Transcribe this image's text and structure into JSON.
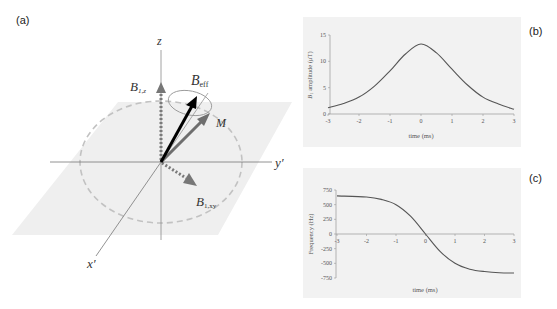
{
  "figure": {
    "panels": {
      "a": {
        "label": "(a)",
        "axes": {
          "z": "z",
          "y": "y′",
          "x": "x′"
        },
        "vectors": {
          "b1z": {
            "symbol": "B",
            "subscript": "1,z"
          },
          "beff": {
            "symbol": "B",
            "subscript": "eff"
          },
          "m": {
            "symbol": "M"
          },
          "b1xy": {
            "symbol": "B",
            "subscript": "1,xy"
          }
        },
        "colors": {
          "plane": "#efefef",
          "dashed_circle": "#bdbdbd",
          "b1_arrows": "#777777",
          "beff_arrow": "#000000",
          "m_arrow": "#6e6e6e",
          "axes": "#888888"
        }
      },
      "b": {
        "label": "(b)"
      },
      "c": {
        "label": "(c)"
      }
    }
  },
  "chart_data": [
    {
      "type": "line",
      "panel": "(b)",
      "title": "",
      "xlabel": "time (ms)",
      "ylabel": "B1 amplitude (μT)",
      "ylabel_symbol": "B",
      "ylabel_sub": "1",
      "ylabel_rest": " amplitude (μT)",
      "xlim": [
        -3,
        3
      ],
      "ylim": [
        0,
        15
      ],
      "xticks": [
        "-3",
        "-2",
        "-1",
        "0",
        "1",
        "2",
        "3"
      ],
      "yticks": [
        "0",
        "5",
        "10",
        "15"
      ],
      "grid": false,
      "series": [
        {
          "name": "B1 amplitude",
          "x": [
            -3,
            -2.5,
            -2,
            -1.5,
            -1,
            -0.5,
            0,
            0.5,
            1,
            1.5,
            2,
            2.5,
            3
          ],
          "values": [
            1.2,
            2.0,
            3.2,
            5.3,
            8.2,
            11.4,
            13.3,
            11.6,
            8.5,
            5.5,
            3.2,
            1.9,
            0.9
          ]
        }
      ]
    },
    {
      "type": "line",
      "panel": "(c)",
      "title": "",
      "xlabel": "time (ms)",
      "ylabel": "Frequency (Hz)",
      "xlim": [
        -3,
        3
      ],
      "ylim": [
        -750,
        750
      ],
      "xticks": [
        "-3",
        "-2",
        "-1",
        "0",
        "1",
        "2",
        "3"
      ],
      "yticks": [
        "750",
        "500",
        "250",
        "0",
        "-250",
        "-500",
        "-750"
      ],
      "grid": false,
      "series": [
        {
          "name": "Frequency",
          "x": [
            -3,
            -2,
            -1.5,
            -1,
            -0.5,
            0,
            0.5,
            1,
            1.5,
            2,
            2.5,
            3
          ],
          "values": [
            650,
            630,
            590,
            500,
            300,
            0,
            -300,
            -500,
            -600,
            -640,
            -660,
            -665
          ]
        }
      ]
    }
  ]
}
